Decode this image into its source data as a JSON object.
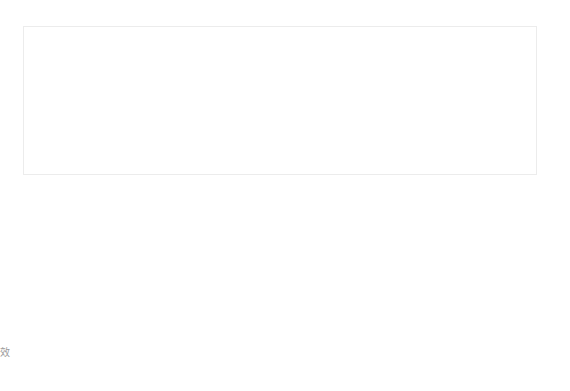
{
  "diagram": {
    "measurement_label": "3-4mm",
    "side_caption": "效",
    "colors": {
      "gum_background": "#dedede",
      "tooth_outline": "#8a8a8a",
      "missing_tooth_fill": "#dcdcdc",
      "implant": "#c9c9c9",
      "annotation_line": "#7f7f7f",
      "label": "#bdbdbd"
    },
    "frame": {
      "x": 23,
      "y": 27,
      "width": 245,
      "height": 147
    },
    "elements": {
      "implant": {
        "x": 204,
        "y": 27,
        "width": 45,
        "height": 72,
        "threads": 8
      },
      "abutment": {
        "x": 227,
        "y1": 99,
        "y2": 130
      },
      "pointer": {
        "from": [
          385,
          278
        ],
        "to": [
          245,
          128
        ],
        "label_position": [
          378,
          300
        ]
      }
    },
    "teeth": [
      {
        "id": "tooth-1",
        "state": "natural"
      },
      {
        "id": "tooth-2",
        "state": "natural"
      },
      {
        "id": "tooth-3",
        "state": "missing-replaced-by-implant"
      },
      {
        "id": "tooth-4",
        "state": "natural"
      },
      {
        "id": "tooth-5",
        "state": "natural"
      },
      {
        "id": "tooth-6",
        "state": "natural"
      }
    ]
  }
}
